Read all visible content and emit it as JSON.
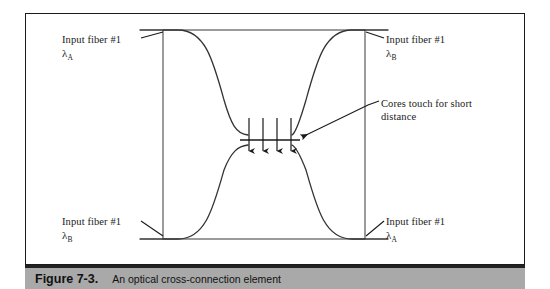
{
  "figure": {
    "caption_number": "Figure 7-3.",
    "caption_text": "An optical cross-connection element",
    "caption_bar_color": "#a9a9a9",
    "line_color": "#1a1a1a",
    "background_color": "#ffffff"
  },
  "labels": {
    "top_left": {
      "text": "Input fiber #1",
      "lambda": "λ",
      "subscript": "A"
    },
    "top_right": {
      "text": "Input fiber #1",
      "lambda": "λ",
      "subscript": "B"
    },
    "bottom_left": {
      "text": "Input fiber #1",
      "lambda": "λ",
      "subscript": "B"
    },
    "bottom_right": {
      "text": "Input fiber #1",
      "lambda": "λ",
      "subscript": "A"
    },
    "cores_note": {
      "line1": "Cores touch for short",
      "line2": "distance"
    }
  },
  "diagram": {
    "inner_box": {
      "x": 163,
      "y": 30,
      "width": 202,
      "height": 209
    },
    "coupling_arrows_count": 4,
    "arrow_x_positions": [
      249,
      263,
      277,
      291
    ],
    "arrow_top_y": 118,
    "arrow_bottom_y": 158,
    "waist_y_top": 135,
    "waist_y_bottom": 145
  }
}
